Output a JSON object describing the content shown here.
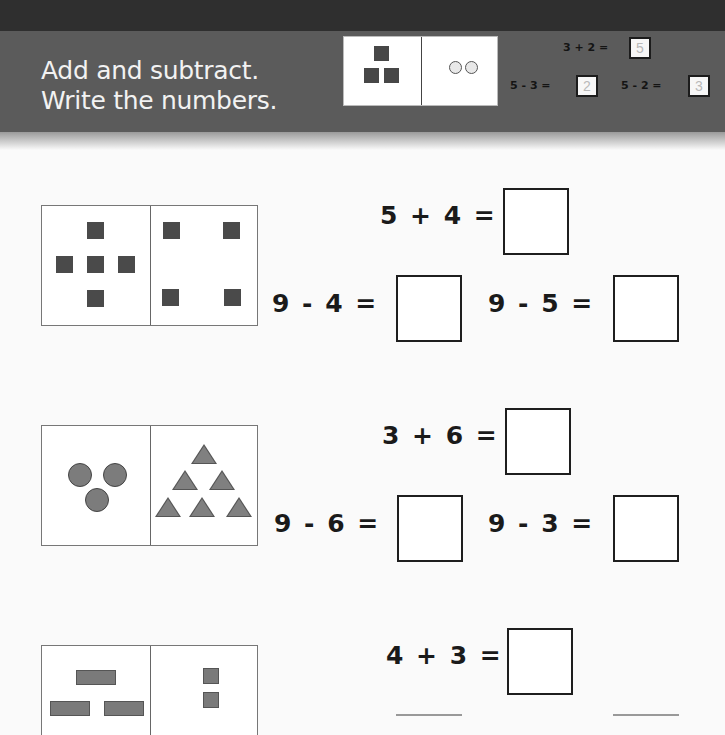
{
  "header": {
    "title_line1": "Add and subtract.",
    "title_line2": "Write the numbers.",
    "colors": {
      "top_strip": "#2f2f2f",
      "band": "#5b5b5b",
      "title_text": "#f2f2f2"
    }
  },
  "example": {
    "left_shapes": "3 dark squares",
    "right_shapes": "2 light circles",
    "equations": [
      {
        "text": "3 + 2 =",
        "answer": "5"
      },
      {
        "text": "5 - 3 =",
        "answer": "2"
      },
      {
        "text": "5 - 2 =",
        "answer": "3"
      }
    ]
  },
  "problems": [
    {
      "left_shapes": {
        "type": "square",
        "count": 5
      },
      "right_shapes": {
        "type": "square",
        "count": 4
      },
      "top_equation": "5 + 4 =",
      "bottom_equations": [
        "9 - 4 =",
        "9 - 5 ="
      ],
      "answers": [
        "",
        "",
        ""
      ]
    },
    {
      "left_shapes": {
        "type": "circle",
        "count": 3
      },
      "right_shapes": {
        "type": "triangle",
        "count": 6
      },
      "top_equation": "3 + 6 =",
      "bottom_equations": [
        "9 - 6 =",
        "9 - 3 ="
      ],
      "answers": [
        "",
        "",
        ""
      ]
    },
    {
      "left_shapes": {
        "type": "rectangle",
        "count": 4
      },
      "right_shapes": {
        "type": "small-rectangle",
        "count": 3
      },
      "top_equation": "4 + 3 =",
      "answers": [
        ""
      ]
    }
  ]
}
